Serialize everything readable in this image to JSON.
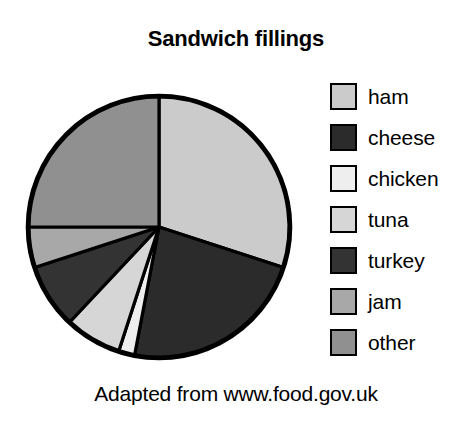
{
  "figure": {
    "title": "Sandwich fillings",
    "caption": "Adapted from www.food.gov.uk"
  },
  "legend": {
    "items": [
      {
        "label": "ham",
        "color": "#cbcbcb"
      },
      {
        "label": "cheese",
        "color": "#2b2b2b"
      },
      {
        "label": "chicken",
        "color": "#eeeeee"
      },
      {
        "label": "tuna",
        "color": "#d6d6d6"
      },
      {
        "label": "turkey",
        "color": "#333333"
      },
      {
        "label": "jam",
        "color": "#a8a8a8"
      },
      {
        "label": "other",
        "color": "#909090"
      }
    ]
  },
  "chart_data": {
    "type": "pie",
    "title": "Sandwich fillings",
    "subtitle": "Adapted from www.food.gov.uk",
    "categories": [
      "ham",
      "cheese",
      "chicken",
      "tuna",
      "turkey",
      "jam",
      "other"
    ],
    "values": [
      30,
      23,
      2,
      7,
      8,
      5,
      25
    ],
    "unit": "percent",
    "total": 100,
    "colors": [
      "#cbcbcb",
      "#2b2b2b",
      "#eeeeee",
      "#d6d6d6",
      "#333333",
      "#a8a8a8",
      "#909090"
    ],
    "start_angle_deg": 0,
    "direction": "clockwise",
    "legend_position": "right",
    "grid": false,
    "data_labels": false,
    "outline_color": "#000000",
    "center_px": {
      "x": 159,
      "y": 227
    },
    "radius_px": 133
  }
}
